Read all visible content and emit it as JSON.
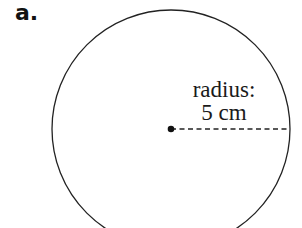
{
  "part_label": "a.",
  "figure": {
    "shape": "circle",
    "center": {
      "x": 171,
      "y": 129
    },
    "radius_px": 119,
    "stroke_color": "#222222",
    "radius_line": "dashed",
    "annotation": {
      "line1": "radius:",
      "line2": "5 cm"
    }
  }
}
